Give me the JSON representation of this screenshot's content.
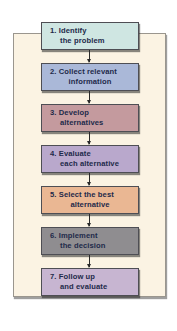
{
  "diagram": {
    "type": "flowchart",
    "direction": "top-to-bottom",
    "background_panel_color": "#fbf3e3",
    "steps": [
      {
        "number": "1.",
        "line1": "1. Identify",
        "line2": "the problem",
        "color": "#cfe6e2"
      },
      {
        "number": "2.",
        "line1": "2. Collect relevant",
        "line2": "information",
        "color": "#aab8d8"
      },
      {
        "number": "3.",
        "line1": "3. Develop",
        "line2": "alternatives",
        "color": "#c49a9e"
      },
      {
        "number": "4.",
        "line1": "4. Evaluate",
        "line2": "each alternative",
        "color": "#b9a8cc"
      },
      {
        "number": "5.",
        "line1": "5. Select the best",
        "line2": "alternative",
        "color": "#eab793"
      },
      {
        "number": "6.",
        "line1": "6. Implement",
        "line2": "the decision",
        "color": "#8f8d90"
      },
      {
        "number": "7.",
        "line1": "7. Follow up",
        "line2": "and evaluate",
        "color": "#c7b5d1"
      }
    ],
    "connectors": [
      {
        "from": 1,
        "to": 2,
        "icon": "arrow-down-icon"
      },
      {
        "from": 2,
        "to": 3,
        "icon": "arrow-down-icon"
      },
      {
        "from": 3,
        "to": 4,
        "icon": "arrow-down-icon"
      },
      {
        "from": 4,
        "to": 5,
        "icon": "arrow-down-icon"
      },
      {
        "from": 5,
        "to": 6,
        "icon": "arrow-down-icon"
      },
      {
        "from": 6,
        "to": 7,
        "icon": "arrow-down-icon"
      }
    ]
  }
}
